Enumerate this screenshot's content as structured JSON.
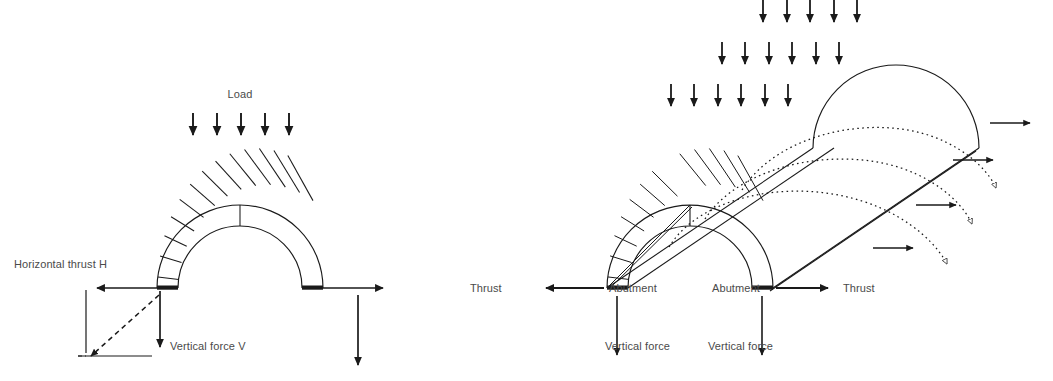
{
  "figure": {
    "ink_color": "#1a1a1a",
    "text_color": "#4a4a4a",
    "background": "#ffffff"
  },
  "left_diagram": {
    "name": "semicircular arch force diagram",
    "labels": {
      "load": "Load",
      "horizontal_thrust": "Horizontal thrust H",
      "vertical_force": "Vertical force V"
    },
    "voussoir_count": 14,
    "load_arrow_count": 5,
    "arch": {
      "center_x": 240,
      "springing_y": 288,
      "inner_radius": 62,
      "outer_radius": 83
    },
    "force_parallelogram": {
      "horizontal_arrow_direction": "left",
      "vertical_arrow_direction": "down",
      "resultant_direction": "down-left",
      "resultant_style": "dashed"
    },
    "right_springing_arrows": {
      "horizontal_direction": "right",
      "vertical_direction": "down"
    }
  },
  "right_diagram": {
    "name": "barrel vault perspective force diagram",
    "labels": {
      "thrust_left": "Thrust",
      "thrust_right": "Thrust",
      "abutment_left": "Abutment",
      "abutment_right": "Abutment",
      "vertical_force_left": "Vertical force",
      "vertical_force_right": "Vertical force"
    },
    "voussoir_count": 14,
    "force_flow_arcs": 3,
    "force_flow_arc_style": "dotted",
    "arc_terminator": "hollow-arrowhead",
    "load_arrow_rows": [
      {
        "row": 1,
        "count": 6
      },
      {
        "row": 2,
        "count": 6
      },
      {
        "row": 3,
        "count": 5
      }
    ],
    "lateral_thrust_arrow_count": 4,
    "front_arch": {
      "center_x": 690,
      "springing_y": 288,
      "inner_radius": 62,
      "outer_radius": 83
    },
    "depth_offset": {
      "dx": 206,
      "dy": -140
    }
  }
}
